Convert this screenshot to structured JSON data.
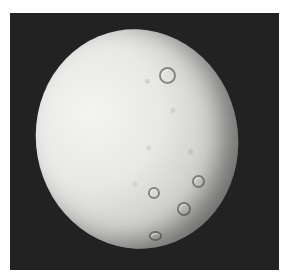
{
  "image": {
    "subject": "Cratered icy moon in space",
    "background_color": "#222222",
    "frame_color": "#ffffff"
  },
  "craters": [
    {
      "name": "large-crater-upper",
      "x": 165,
      "y": 73,
      "d": 13
    },
    {
      "name": "crater-lower-right-1",
      "x": 196,
      "y": 179,
      "d": 9
    },
    {
      "name": "crater-lower-right-2",
      "x": 182,
      "y": 207,
      "d": 10
    },
    {
      "name": "crater-lower-mid",
      "x": 152,
      "y": 191,
      "d": 8
    },
    {
      "name": "crater-bottom",
      "x": 153,
      "y": 234,
      "d": 8
    }
  ]
}
